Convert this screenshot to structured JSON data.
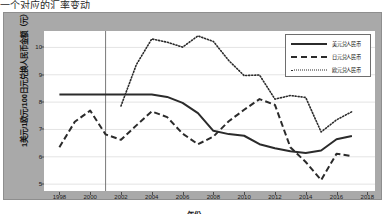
{
  "top_partial_text": "一个对应的汇率变动",
  "axes": {
    "ylabel": "1美元/1欧元/100日元兑换人民币金额（元）",
    "xlabel": "年份",
    "yticks": [
      "5",
      "6",
      "7",
      "8",
      "9",
      "10"
    ],
    "xticks": [
      "1998",
      "2000",
      "2002",
      "2004",
      "2006",
      "2008",
      "2010",
      "2012",
      "2014",
      "2016",
      "2018"
    ]
  },
  "legend": {
    "items": [
      {
        "label": "美元兑人民币",
        "style": "solid"
      },
      {
        "label": "日元兑人民币",
        "style": "dashed"
      },
      {
        "label": "欧元兑人民币",
        "style": "dotted"
      }
    ]
  },
  "chart_data": {
    "type": "line",
    "title": "",
    "xlabel": "年份",
    "ylabel": "1美元/1欧元/100日元兑换人民币金额（元）",
    "xlim": [
      1997,
      2018.5
    ],
    "ylim": [
      4.75,
      10.6
    ],
    "grid": true,
    "legend_position": "top-right",
    "annotations": [
      {
        "type": "vertical-line",
        "x": 2001,
        "label": ""
      }
    ],
    "x": [
      1998,
      1999,
      2000,
      2001,
      2002,
      2003,
      2004,
      2005,
      2006,
      2007,
      2008,
      2009,
      2010,
      2011,
      2012,
      2013,
      2014,
      2015,
      2016,
      2017
    ],
    "series": [
      {
        "name": "美元兑人民币",
        "style": "solid",
        "values": [
          8.28,
          8.28,
          8.28,
          8.28,
          8.28,
          8.28,
          8.28,
          8.19,
          7.97,
          7.6,
          6.95,
          6.83,
          6.77,
          6.46,
          6.31,
          6.2,
          6.14,
          6.23,
          6.64,
          6.76
        ]
      },
      {
        "name": "日元兑人民币",
        "style": "dashed",
        "values": [
          6.35,
          7.28,
          7.69,
          6.82,
          6.62,
          7.15,
          7.66,
          7.45,
          6.85,
          6.46,
          6.74,
          7.3,
          7.72,
          8.11,
          7.9,
          6.35,
          5.81,
          5.15,
          6.11,
          6.03
        ]
      },
      {
        "name": "欧元兑人民币",
        "style": "dotted",
        "values": [
          null,
          null,
          null,
          null,
          7.86,
          9.37,
          10.31,
          10.19,
          10.01,
          10.42,
          10.22,
          9.52,
          8.97,
          8.99,
          8.11,
          8.24,
          8.17,
          6.91,
          7.35,
          7.65
        ]
      }
    ]
  }
}
